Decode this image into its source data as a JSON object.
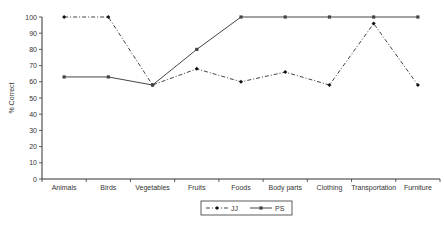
{
  "chart_data": {
    "type": "line",
    "title": "",
    "xlabel": "",
    "ylabel": "% Correct",
    "ylim": [
      0,
      100
    ],
    "yticks": [
      0,
      10,
      20,
      30,
      40,
      50,
      60,
      70,
      80,
      90,
      100
    ],
    "grid": false,
    "legend_position": "bottom",
    "categories": [
      "Animals",
      "Birds",
      "Vegetables",
      "Fruits",
      "Foods",
      "Body parts",
      "Clothing",
      "Transportation",
      "Furniture"
    ],
    "series": [
      {
        "name": "JJ",
        "style": "dash-dot",
        "marker": "diamond",
        "values": [
          100,
          100,
          58,
          68,
          60,
          66,
          58,
          96,
          58
        ]
      },
      {
        "name": "PS",
        "style": "solid",
        "marker": "square",
        "values": [
          63,
          63,
          58,
          80,
          100,
          100,
          100,
          100,
          100
        ]
      }
    ]
  },
  "colors": {
    "line": "#444444",
    "axis": "#333333"
  }
}
